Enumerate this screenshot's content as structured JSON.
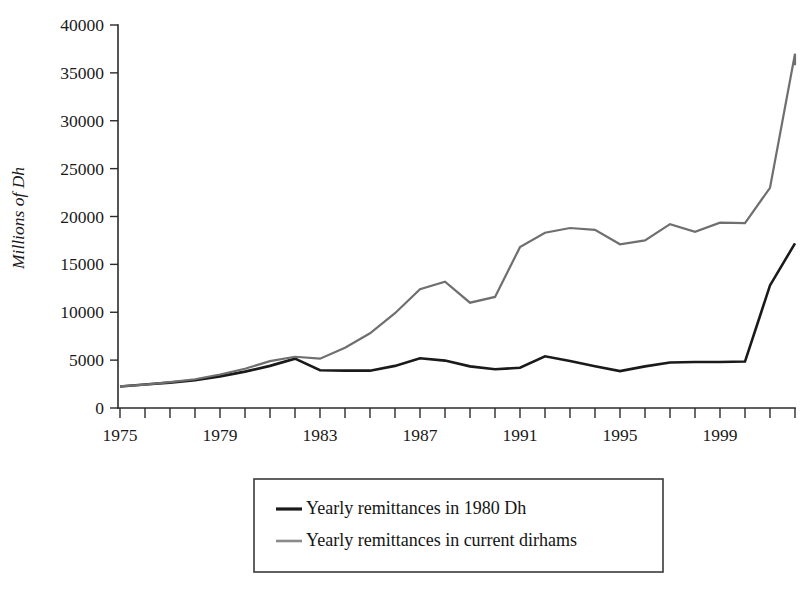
{
  "chart_data": {
    "type": "line",
    "title": "",
    "xlabel": "",
    "ylabel": "Millions of Dh",
    "xlim": [
      1975,
      2002
    ],
    "ylim": [
      0,
      40000
    ],
    "grid": false,
    "legend_position": "bottom-center",
    "y_ticks": [
      0,
      5000,
      10000,
      15000,
      20000,
      25000,
      30000,
      35000,
      40000
    ],
    "y_tick_labels": [
      "0",
      "5000",
      "10000",
      "15000",
      "20000",
      "25000",
      "30000",
      "35000",
      "40000"
    ],
    "x_ticks": [
      1975,
      1976,
      1977,
      1978,
      1979,
      1980,
      1981,
      1982,
      1983,
      1984,
      1985,
      1986,
      1987,
      1988,
      1989,
      1990,
      1991,
      1992,
      1993,
      1994,
      1995,
      1996,
      1997,
      1998,
      1999,
      2000,
      2001,
      2002
    ],
    "x_tick_labels": [
      {
        "value": 1975,
        "label": "1975"
      },
      {
        "value": 1979,
        "label": "1979"
      },
      {
        "value": 1983,
        "label": "1983"
      },
      {
        "value": 1987,
        "label": "1987"
      },
      {
        "value": 1991,
        "label": "1991"
      },
      {
        "value": 1995,
        "label": "1995"
      },
      {
        "value": 1999,
        "label": "1999"
      }
    ],
    "x": [
      1975,
      1976,
      1977,
      1978,
      1979,
      1980,
      1981,
      1982,
      1983,
      1984,
      1985,
      1986,
      1987,
      1988,
      1989,
      1990,
      1991,
      1992,
      1993,
      1994,
      1995,
      1996,
      1997,
      1998,
      1999,
      2000,
      2001,
      2002
    ],
    "series": [
      {
        "name": "Yearly remittances in 1980 Dh",
        "color": "#1a1a1a",
        "width": 2.6,
        "values": [
          2250,
          2450,
          2650,
          2900,
          3300,
          3800,
          4400,
          5150,
          3950,
          3900,
          3900,
          4400,
          5200,
          4950,
          4350,
          4050,
          4200,
          5400,
          4900,
          4350,
          3850,
          4350,
          4750,
          4800,
          4800,
          4850,
          12800,
          17200
        ]
      },
      {
        "name": "Yearly remittances in current dirhams",
        "color": "#6f6f6f",
        "width": 2.2,
        "values": [
          2250,
          2450,
          2700,
          3000,
          3500,
          4100,
          4900,
          5350,
          5150,
          6300,
          7800,
          9900,
          12400,
          13200,
          11000,
          11600,
          16800,
          18300,
          18800,
          18600,
          17100,
          17500,
          19200,
          18400,
          19350,
          19300,
          23000,
          37000
        ]
      }
    ],
    "series_tail_note": {
      "final_gray_value": 35800
    },
    "legend_entries": [
      {
        "label": "Yearly remittances in 1980 Dh",
        "color": "#1a1a1a",
        "width": 3.2
      },
      {
        "label": "Yearly remittances in current dirhams",
        "color": "#8a8a8a",
        "width": 2.6
      }
    ]
  }
}
